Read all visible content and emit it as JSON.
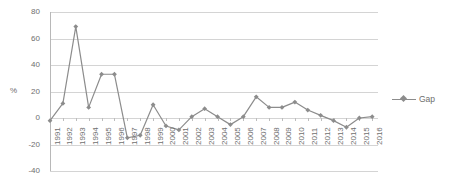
{
  "chart_data": {
    "type": "line",
    "title": "",
    "xlabel": "",
    "ylabel": "%",
    "ylim": [
      -40,
      80
    ],
    "yticks": [
      80,
      60,
      40,
      20,
      0,
      -20,
      -40
    ],
    "grid": true,
    "legend_position": "right",
    "series": [
      {
        "name": "Gap",
        "color": "#8c8c8c",
        "marker": "diamond",
        "values": [
          -2,
          11,
          69,
          8,
          33,
          33,
          -15,
          -13,
          10,
          -6,
          -9,
          1,
          7,
          1,
          -5,
          1,
          16,
          8,
          8,
          12,
          6,
          2,
          -2,
          -7,
          0,
          1
        ]
      }
    ],
    "categories": [
      "1991",
      "1992",
      "1993",
      "1994",
      "1995",
      "1996",
      "1997",
      "1998",
      "1999",
      "2000",
      "2001",
      "2002",
      "2003",
      "2004",
      "2005",
      "2006",
      "2007",
      "2008",
      "2009",
      "2010",
      "2011",
      "2012",
      "2013",
      "2014",
      "2015",
      "2016"
    ]
  },
  "legend": {
    "entries": [
      {
        "label": "Gap"
      }
    ]
  },
  "axes": {
    "y_title": "%"
  }
}
